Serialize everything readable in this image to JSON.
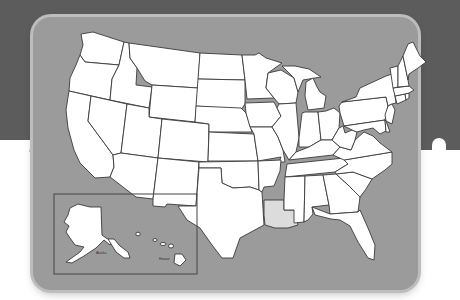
{
  "map": {
    "title": "United States outline map",
    "highlighted_state": "Louisiana",
    "colors": {
      "background_top": "#5c5c5c",
      "background_bottom": "#ffffff",
      "card_fill": "#9b9b9b",
      "card_border": "#bdbdbd",
      "state_fill": "#ffffff",
      "state_stroke": "#3a3a3a",
      "highlight_fill": "#dcdcdc"
    },
    "inset": {
      "alaska_label": "Alaska",
      "hawaii_label": "Hawaii"
    },
    "states": [
      "Washington",
      "Oregon",
      "California",
      "Idaho",
      "Nevada",
      "Montana",
      "Wyoming",
      "Utah",
      "Arizona",
      "Colorado",
      "New Mexico",
      "North Dakota",
      "South Dakota",
      "Nebraska",
      "Kansas",
      "Oklahoma",
      "Texas",
      "Minnesota",
      "Iowa",
      "Missouri",
      "Arkansas",
      "Louisiana",
      "Wisconsin",
      "Illinois",
      "Michigan",
      "Indiana",
      "Ohio",
      "Kentucky",
      "Tennessee",
      "Mississippi",
      "Alabama",
      "Georgia",
      "Florida",
      "South Carolina",
      "North Carolina",
      "Virginia",
      "West Virginia",
      "Pennsylvania",
      "New York",
      "Maryland",
      "Delaware",
      "New Jersey",
      "Connecticut",
      "Rhode Island",
      "Massachusetts",
      "Vermont",
      "New Hampshire",
      "Maine",
      "Alaska",
      "Hawaii"
    ]
  }
}
